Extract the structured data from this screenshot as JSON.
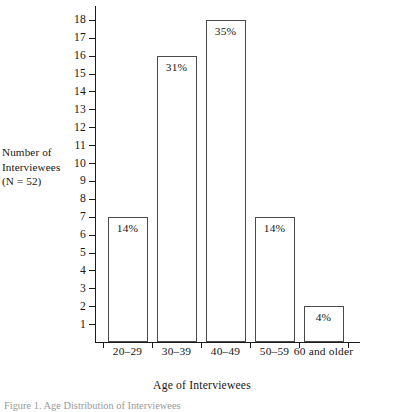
{
  "chart_data": {
    "type": "bar",
    "title": "",
    "categories": [
      "20–29",
      "30–39",
      "40–49",
      "50–59",
      "60 and older"
    ],
    "values": [
      7,
      16,
      18,
      7,
      2
    ],
    "data_labels": [
      "14%",
      "31%",
      "35%",
      "14%",
      "4%"
    ],
    "xlabel": "Age of Interviewees",
    "ylabel": "Number of Interviewees (N = 52)",
    "ylabel_lines": [
      "Number of",
      "Interviewees",
      "(N = 52)"
    ],
    "ylim": [
      0,
      18
    ],
    "ytick_labels": [
      "18",
      "17",
      "16",
      "15",
      "14",
      "13",
      "12",
      "11",
      "10",
      "9",
      "8",
      "7",
      "6",
      "5",
      "4",
      "3",
      "2",
      "1"
    ],
    "ytick_values": [
      18,
      17,
      16,
      15,
      14,
      13,
      12,
      11,
      10,
      9,
      8,
      7,
      6,
      5,
      4,
      3,
      2,
      1
    ],
    "grid": false,
    "legend": null,
    "series": [
      {
        "name": "Number of Interviewees",
        "values": [
          7,
          16,
          18,
          7,
          2
        ]
      }
    ]
  },
  "figure": {
    "caption": "Figure 1. Age Distribution of Interviewees"
  },
  "colors": {
    "bar_fill": "#ffffff",
    "bar_stroke": "#4a4a4a",
    "axis": "#1b1b1b",
    "text": "#161616",
    "background": "#ffffff"
  }
}
